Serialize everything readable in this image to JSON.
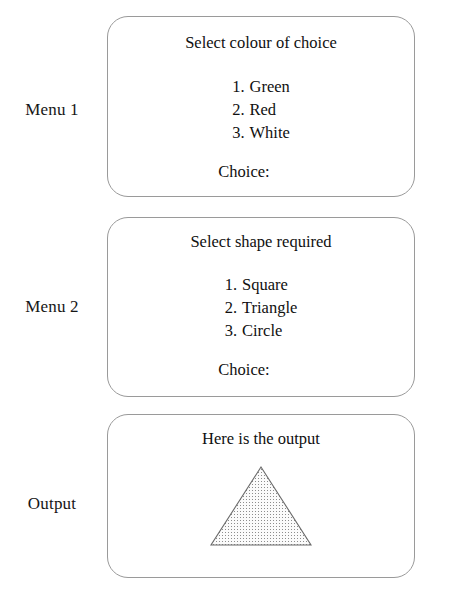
{
  "rows": [
    {
      "label": "Menu 1"
    },
    {
      "label": "Menu 2"
    },
    {
      "label": "Output"
    }
  ],
  "menu1": {
    "title": "Select colour of choice",
    "options": [
      {
        "num": "1.",
        "label": "Green"
      },
      {
        "num": "2.",
        "label": "Red"
      },
      {
        "num": "3.",
        "label": "White"
      }
    ],
    "choice_label": "Choice:",
    "choice_value": ""
  },
  "menu2": {
    "title": "Select shape required",
    "options": [
      {
        "num": "1.",
        "label": "Square"
      },
      {
        "num": "2.",
        "label": "Triangle"
      },
      {
        "num": "3.",
        "label": "Circle"
      }
    ],
    "choice_label": "Choice:",
    "choice_value": ""
  },
  "output": {
    "title": "Here is the output",
    "shape": "triangle",
    "shape_fill": "#f4f4f4",
    "shape_stroke": "#6b6b6b",
    "shape_pattern": "dotted-grid"
  },
  "style": {
    "panel_border": "#9a9a9a",
    "background": "#ffffff",
    "text": "#101010"
  }
}
